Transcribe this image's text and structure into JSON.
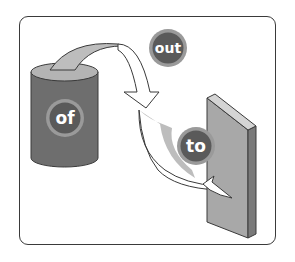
{
  "diagram": {
    "labels": {
      "source": "of",
      "transfer": "out",
      "target": "to"
    },
    "shapes": {
      "source": "cylinder",
      "target": "panel"
    },
    "colors": {
      "frame_border": "#3a3a3a",
      "cylinder_body": "#6e6e6e",
      "cylinder_top": "#b4b4b4",
      "panel_front": "#a8a8a8",
      "panel_side": "#7a7a7a",
      "panel_top": "#d4d4d4",
      "arrow_fill_gray": "#bdbdbd",
      "arrow_fill_white": "#ffffff",
      "badge_fill": "#5a5a5a",
      "badge_ring": "#9a9a9a",
      "badge_text": "#ffffff"
    }
  }
}
